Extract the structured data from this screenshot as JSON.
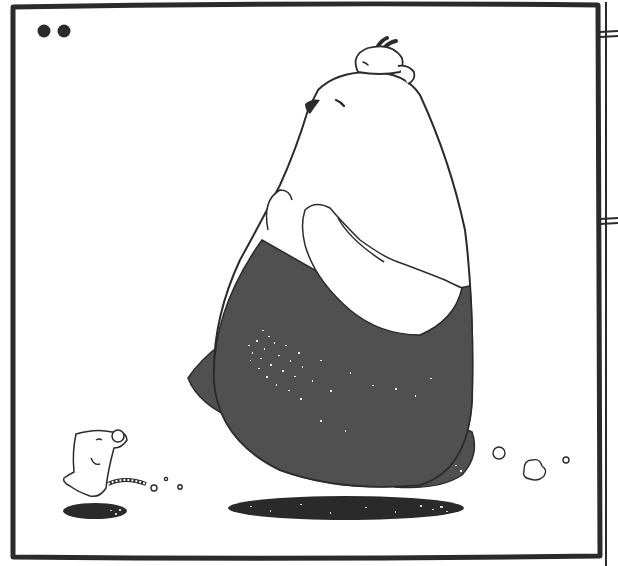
{
  "image": {
    "kind": "comic-panel",
    "width": 618,
    "height": 566,
    "text": []
  },
  "colors": {
    "background": "#ffffff",
    "ink": "#2b2b2b",
    "bear_dark": "#505050",
    "shadow": "#2a2a2a"
  },
  "panel": {
    "border": {
      "x": 12,
      "y": 5,
      "w": 588,
      "h": 553
    },
    "dots": [
      {
        "cx": 44,
        "cy": 31,
        "r": 6.5
      },
      {
        "cx": 64,
        "cy": 31,
        "r": 6.5
      }
    ]
  },
  "adjacent_panel_edge": {
    "x": 604
  },
  "characters": [
    {
      "name": "big-bear",
      "description": "Large white-and-dark-grey bear walking left, eyes closed, looking up"
    },
    {
      "name": "small-rabbit",
      "description": "Small white rabbit resting on top of the bear's head"
    },
    {
      "name": "mouse",
      "description": "Small white mouse walking behind, smiling, eyes closed"
    }
  ],
  "effects": [
    {
      "name": "dust-puff",
      "count": 3,
      "position": "behind bear"
    },
    {
      "name": "dust-puff",
      "count": 3,
      "position": "behind mouse"
    },
    {
      "name": "ground-shadow",
      "count": 2
    }
  ]
}
